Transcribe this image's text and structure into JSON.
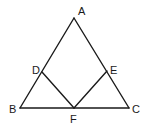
{
  "diagram": {
    "points": {
      "A": {
        "label": "A",
        "x": 74,
        "y": 18
      },
      "B": {
        "label": "B",
        "x": 20,
        "y": 108
      },
      "C": {
        "label": "C",
        "x": 129,
        "y": 108
      },
      "D": {
        "label": "D",
        "x": 42,
        "y": 72
      },
      "E": {
        "label": "E",
        "x": 107,
        "y": 71
      },
      "F": {
        "label": "F",
        "x": 74,
        "y": 108
      }
    },
    "segments": [
      "AB",
      "BC",
      "CA",
      "DF",
      "EF"
    ],
    "line_color": "#1a1a1a",
    "background": "#ffffff"
  }
}
